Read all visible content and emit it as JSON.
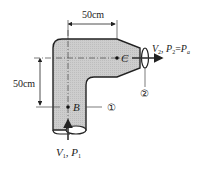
{
  "figure": {
    "type": "pipe-elbow-nozzle",
    "fill_color": "#c8c8c8",
    "stroke_color": "#222222",
    "dimensions": {
      "horizontal": {
        "label": "50cm"
      },
      "vertical": {
        "label": "50cm"
      }
    },
    "points": {
      "B": {
        "label": "B"
      },
      "C": {
        "label": "C"
      }
    },
    "sections": {
      "inlet": {
        "marker": "①"
      },
      "outlet": {
        "marker": "②"
      }
    },
    "inlet_flow": {
      "v": "V",
      "v_sub": "1",
      "sep": ", ",
      "p": "P",
      "p_sub": "1"
    },
    "outlet_flow": {
      "v": "V",
      "v_sub": "2",
      "sep": ", ",
      "p": "P",
      "p_sub": "2",
      "eq": "=",
      "pa": "P",
      "pa_sub": "a"
    }
  }
}
